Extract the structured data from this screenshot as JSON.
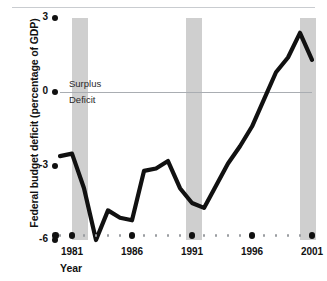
{
  "chart_data": {
    "type": "line",
    "title": "",
    "xlabel": "Year",
    "ylabel": "Federal budget deficit (percentage of GDP)",
    "xlim": [
      1980,
      2001
    ],
    "ylim": [
      -6,
      3
    ],
    "ytick_labels": [
      "3",
      "0",
      "-3",
      "-6"
    ],
    "ytick_values": [
      3,
      0,
      -3,
      -6
    ],
    "xtick_labels": [
      "1981",
      "1986",
      "1991",
      "1996",
      "2001"
    ],
    "xtick_values": [
      1981,
      1986,
      1991,
      1996,
      2001
    ],
    "grid": false,
    "legend": "none",
    "x": [
      1980,
      1981,
      1982,
      1983,
      1984,
      1985,
      1986,
      1987,
      1988,
      1989,
      1990,
      1991,
      1992,
      1993,
      1994,
      1995,
      1996,
      1997,
      1998,
      1999,
      2000,
      2001
    ],
    "values": [
      -2.6,
      -2.5,
      -3.9,
      -6.0,
      -4.8,
      -5.1,
      -5.2,
      -3.2,
      -3.1,
      -2.8,
      -3.9,
      -4.5,
      -4.7,
      -3.8,
      -2.9,
      -2.2,
      -1.4,
      -0.3,
      0.8,
      1.4,
      2.4,
      1.3
    ],
    "series": [
      {
        "name": "Federal budget deficit (percentage of GDP)",
        "color": "#111111",
        "values": [
          -2.6,
          -2.5,
          -3.9,
          -6.0,
          -4.8,
          -5.1,
          -5.2,
          -3.2,
          -3.1,
          -2.8,
          -3.9,
          -4.5,
          -4.7,
          -3.8,
          -2.9,
          -2.2,
          -1.4,
          -0.3,
          0.8,
          1.4,
          2.4,
          1.3
        ]
      }
    ],
    "annotations": [
      {
        "text": "Surplus",
        "at_value": 0,
        "position": "above-zero-line"
      },
      {
        "text": "Deficit",
        "at_value": 0,
        "position": "below-zero-line"
      }
    ],
    "shaded_bands": [
      {
        "label": "recession-band-1",
        "start": 1981.0,
        "end": 1982.3,
        "color": "#cfcfcf"
      },
      {
        "label": "recession-band-2",
        "start": 1990.5,
        "end": 1991.8,
        "color": "#cfcfcf"
      },
      {
        "label": "recession-band-3",
        "start": 2000.0,
        "end": 2001.3,
        "color": "#cfcfcf"
      }
    ],
    "colors": {
      "line": "#111111",
      "band": "#cfcfcf",
      "zero_line": "#a9adb2",
      "tick_marker": "#111111",
      "minor_tick": "#9a9da1",
      "background": "#ffffff"
    }
  },
  "axis": {
    "y_title": "Federal budget deficit (percentage of GDP)",
    "x_title": "Year"
  },
  "annotations": {
    "surplus": "Surplus",
    "deficit": "Deficit"
  }
}
